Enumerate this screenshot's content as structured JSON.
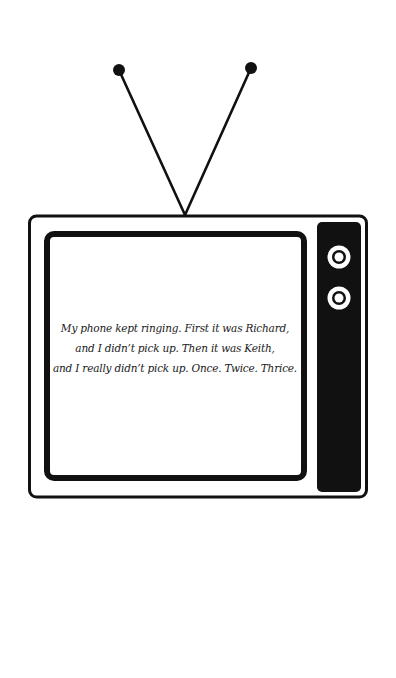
{
  "illustration": {
    "subject": "retro television set",
    "colors": {
      "ink": "#111111",
      "paper": "#ffffff"
    },
    "screen": {
      "lines": [
        "My phone kept ringing. First it was Richard,",
        "and I didn’t pick up. Then it was Keith,",
        "and I really didn’t pick up. Once. Twice. Thrice."
      ]
    },
    "knobs": [
      "knob-top",
      "knob-bottom"
    ]
  }
}
